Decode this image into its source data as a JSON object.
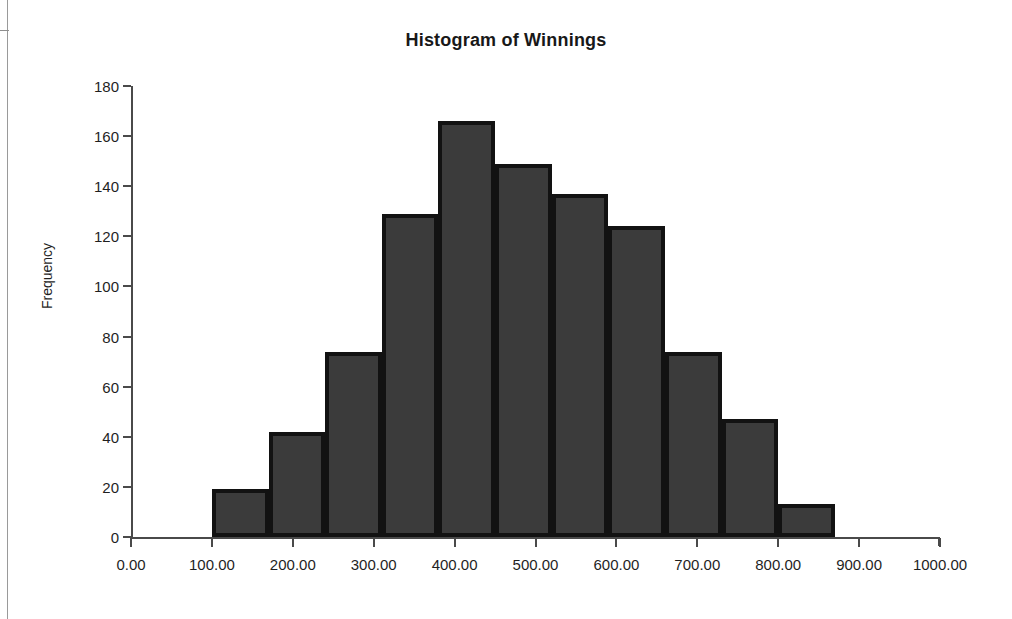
{
  "chart_data": {
    "type": "bar",
    "title": "Histogram of Winnings",
    "xlabel": "",
    "ylabel": "Frequency",
    "grid": false,
    "legend": "none",
    "xlim": [
      0,
      1000
    ],
    "ylim": [
      0,
      180
    ],
    "ytick_step": 20,
    "xtick_step": 100,
    "y_ticks": [
      "0",
      "20",
      "40",
      "60",
      "80",
      "100",
      "120",
      "140",
      "160",
      "180"
    ],
    "y_tick_values": [
      0,
      20,
      40,
      60,
      80,
      100,
      120,
      140,
      160,
      180
    ],
    "x_ticks": [
      "0.00",
      "100.00",
      "200.00",
      "300.00",
      "400.00",
      "500.00",
      "600.00",
      "700.00",
      "800.00",
      "900.00",
      "1000.00"
    ],
    "x_tick_values": [
      0,
      100,
      200,
      300,
      400,
      500,
      600,
      700,
      800,
      900,
      1000
    ],
    "bin_width": 70,
    "bin_edges": [
      100,
      170,
      240,
      310,
      380,
      450,
      520,
      590,
      660,
      730,
      800,
      870
    ],
    "categories": [
      "100-170",
      "170-240",
      "240-310",
      "310-380",
      "380-450",
      "450-520",
      "520-590",
      "590-660",
      "660-730",
      "730-800",
      "800-870"
    ],
    "values": [
      19,
      42,
      74,
      129,
      166,
      149,
      137,
      124,
      74,
      47,
      13
    ],
    "bar_fill_color": "#3b3b3b",
    "bar_border_color": "#121212",
    "axis_color": "#4a4a4a",
    "background_color": "#ffffff"
  },
  "chart": {
    "title": "Histogram of Winnings",
    "y_axis_title": "Frequency"
  }
}
